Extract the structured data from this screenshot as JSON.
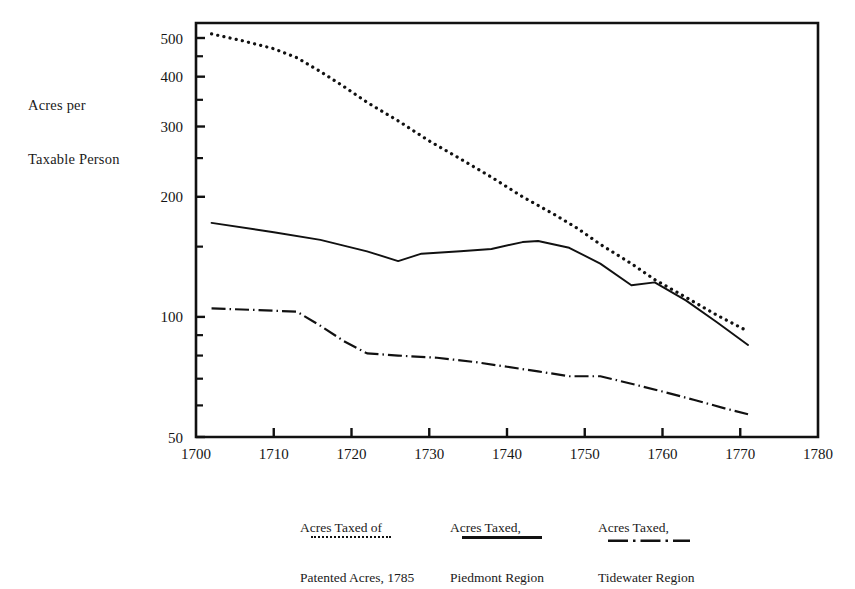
{
  "axis_label": {
    "line1": "Acres per",
    "line2": "Taxable Person"
  },
  "chart_data": {
    "type": "line",
    "title": "",
    "xlabel": "",
    "ylabel": "Acres per Taxable Person",
    "xlim": [
      1700,
      1780
    ],
    "ylim": [
      50,
      530
    ],
    "yscale": "log",
    "grid": false,
    "legend_position": "below",
    "xticks": [
      1700,
      1710,
      1720,
      1730,
      1740,
      1750,
      1760,
      1770,
      1780
    ],
    "xtick_labels": [
      "1700",
      "1710",
      "1720",
      "1730",
      "1740",
      "1750",
      "1760",
      "1770",
      "1780"
    ],
    "yticks": [
      50,
      100,
      200,
      300,
      400,
      500
    ],
    "ytick_labels": [
      "50",
      "100",
      "200",
      "300",
      "400",
      "500"
    ],
    "yticks_minor": [
      60,
      70,
      80,
      90,
      150,
      250,
      350,
      450
    ],
    "series": [
      {
        "name": "Acres Taxed of Patented Acres, 1785",
        "style": "dotted",
        "color": "#111111",
        "x": [
          1702,
          1706,
          1710,
          1713,
          1716,
          1719,
          1722,
          1726,
          1730,
          1734,
          1738,
          1742,
          1746,
          1749,
          1752,
          1756,
          1759,
          1763,
          1767,
          1771
        ],
        "y": [
          512,
          492,
          470,
          446,
          412,
          378,
          345,
          310,
          276,
          249,
          224,
          200,
          181,
          167,
          152,
          136,
          124,
          112,
          101,
          92
        ]
      },
      {
        "name": "Acres Taxed, Piedmont Region",
        "style": "solid",
        "color": "#111111",
        "x": [
          1702,
          1710,
          1716,
          1722,
          1726,
          1729,
          1734,
          1738,
          1742,
          1744,
          1748,
          1752,
          1756,
          1759,
          1763,
          1767,
          1771
        ],
        "y": [
          172,
          163,
          156,
          146,
          138,
          144,
          146,
          148,
          154,
          155,
          149,
          136,
          120,
          122,
          110,
          97,
          85
        ]
      },
      {
        "name": "Acres Taxed, Tidewater Region",
        "style": "dash-dot",
        "color": "#111111",
        "x": [
          1702,
          1708,
          1713,
          1716,
          1719,
          1722,
          1726,
          1731,
          1736,
          1740,
          1744,
          1748,
          1752,
          1756,
          1760,
          1764,
          1768,
          1771
        ],
        "y": [
          105,
          104,
          103,
          95,
          87,
          81,
          80,
          79,
          77,
          75,
          73,
          71,
          71,
          68,
          65,
          62,
          59,
          57
        ]
      }
    ]
  },
  "legend": [
    {
      "line1": "Acres Taxed of",
      "line2": "Patented Acres, 1785",
      "key": "dotted-line-key"
    },
    {
      "line1": "Acres Taxed,",
      "line2": "Piedmont Region",
      "key": "solid-line-key"
    },
    {
      "line1": "Acres Taxed,",
      "line2": "Tidewater Region",
      "key": "dash-dot-line-key"
    }
  ]
}
